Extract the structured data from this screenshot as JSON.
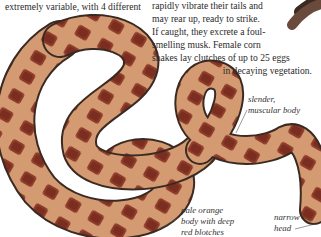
{
  "left_column": {
    "text_fragment": "extremely variable, with 4 different"
  },
  "right_column": {
    "lines": [
      "rapidly vibrate their tails and",
      "may rear up, ready to strike.",
      "If caught, they excrete a foul-",
      "smelling musk. Female corn",
      "snakes lay clutches of up to 25 eggs",
      "in decaying vegetation."
    ]
  },
  "annotations": {
    "body": [
      "slender,",
      "muscular body"
    ],
    "coloring": [
      "pale orange",
      "body with deep",
      "red blotches"
    ],
    "head": [
      "narrow",
      "head"
    ]
  },
  "colors": {
    "body_base": "#d49a72",
    "blotch": "#8e3b2a",
    "outline": "#3a2a22",
    "text": "#2a2a2a"
  }
}
